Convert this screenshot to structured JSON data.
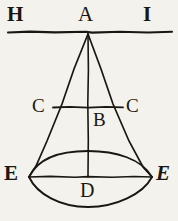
{
  "figure": {
    "background_color": "#f4f2ec",
    "ink_color": "#1a1712",
    "labels": [
      {
        "id": "H",
        "text": "H",
        "role": "horizon-line-left-endpoint"
      },
      {
        "id": "A",
        "text": "A",
        "role": "cone-apex"
      },
      {
        "id": "I",
        "text": "I",
        "role": "horizon-line-right-endpoint"
      },
      {
        "id": "C-left",
        "text": "C",
        "role": "mid-chord-left-endpoint"
      },
      {
        "id": "C-right",
        "text": "C",
        "role": "mid-chord-right-endpoint"
      },
      {
        "id": "B",
        "text": "B",
        "role": "axis-midpoint"
      },
      {
        "id": "E-left",
        "text": "E",
        "role": "base-left-endpoint"
      },
      {
        "id": "E-right",
        "text": "E",
        "role": "base-right-endpoint"
      },
      {
        "id": "D",
        "text": "D",
        "role": "base-center"
      }
    ],
    "geometry": {
      "apex": {
        "x": 88,
        "y": 33
      },
      "horizon_line": {
        "x1": 8,
        "y1": 32,
        "x2": 172,
        "y2": 32
      },
      "axis": {
        "x1": 88,
        "y1": 33,
        "x2": 88,
        "y2": 177
      },
      "mid_chord": {
        "x1": 53,
        "y1": 107,
        "x2": 123,
        "y2": 107
      },
      "base_chord": {
        "x1": 29,
        "y1": 177,
        "x2": 152,
        "y2": 177
      },
      "left_side": {
        "x1": 88,
        "y1": 33,
        "x2": 29,
        "y2": 177
      },
      "right_side": {
        "x1": 88,
        "y1": 33,
        "x2": 152,
        "y2": 177
      },
      "base_top_arc_apex": {
        "x": 88,
        "y": 151
      },
      "base_bottom_arc_apex": {
        "x": 88,
        "y": 207
      }
    }
  }
}
